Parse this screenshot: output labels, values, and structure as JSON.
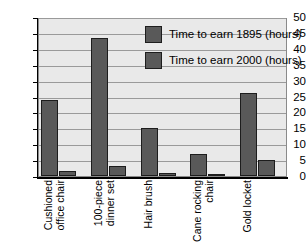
{
  "chart_data": {
    "type": "bar",
    "title": "",
    "xlabel": "",
    "ylabel": "",
    "ylim": [
      0,
      50
    ],
    "ytick_step": 5,
    "yticks": [
      "0",
      "5",
      "10",
      "15",
      "20",
      "25",
      "30",
      "35",
      "40",
      "45",
      "50"
    ],
    "grid": true,
    "legend_position": "top-right-inside",
    "categories": [
      "Cushioned office chair",
      "100-piece dinner set",
      "Hair brush",
      "Cane rocking chair",
      "Gold locket"
    ],
    "category_lines": [
      [
        "Cushioned",
        "office chair"
      ],
      [
        "100-piece",
        "dinner set"
      ],
      [
        "Hair brush"
      ],
      [
        "Cane rocking",
        "chair"
      ],
      [
        "Gold locket"
      ]
    ],
    "series": [
      {
        "name": "Time to earn 1895 (hours)",
        "color": "#595959",
        "values": [
          24,
          43.5,
          15,
          7,
          26
        ]
      },
      {
        "name": "Time to earn 2000 (hours)",
        "color": "#595959",
        "values": [
          1.7,
          3,
          1,
          0.7,
          5
        ]
      }
    ]
  },
  "colors": {
    "bar": "#595959",
    "bar_edge": "#1d1d1d",
    "plot_background": "#e9e9e9",
    "gridline": "#9a9a9a",
    "axis": "#000000",
    "page_background": "#ffffff"
  }
}
